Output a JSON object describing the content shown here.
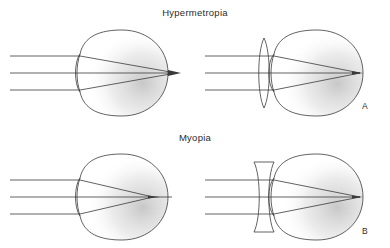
{
  "figure": {
    "background_color": "#ffffff",
    "ink_color": "#3a3a3a",
    "text_color": "#2b2b2b",
    "shading_color": "#8a8a8a",
    "width": 390,
    "height": 248
  },
  "titles": {
    "hypermetropia": "Hypermetropia",
    "myopia": "Myopia"
  },
  "panel_labels": {
    "a": "A",
    "b": "B"
  },
  "icons": {
    "convex_lens": "biconvex-lens-icon",
    "concave_lens": "biconcave-lens-icon",
    "eyeball": "eyeball-icon",
    "light_ray": "light-ray-icon"
  },
  "diagrams": [
    {
      "id": "hypermetropia-uncorrected",
      "row": "hypermetropia",
      "position": "left",
      "condition": "Hypermetropia",
      "corrected": false,
      "lens": null,
      "focal_point_relative_to_retina": "behind",
      "ray_count": 3,
      "eye": {
        "center_x": 123,
        "center_y": 73,
        "radius_x": 45,
        "radius_y": 43,
        "cornea_apex_x": 78,
        "retina_x": 168
      },
      "rays": {
        "start_x": 10,
        "y_values": [
          56,
          73,
          90
        ],
        "entry_x": 80,
        "focus_x": 176,
        "focus_y": 73
      }
    },
    {
      "id": "hypermetropia-corrected",
      "row": "hypermetropia",
      "position": "right",
      "condition": "Hypermetropia",
      "corrected": true,
      "lens": "biconvex",
      "focal_point_relative_to_retina": "on retina",
      "ray_count": 3,
      "eye": {
        "center_x": 318,
        "center_y": 73,
        "radius_x": 45,
        "radius_y": 43,
        "cornea_apex_x": 272,
        "retina_x": 363
      },
      "lens_geometry": {
        "center_x": 264,
        "center_y": 73,
        "half_height": 35,
        "bulge": 7
      },
      "rays": {
        "start_x": 205,
        "y_values": [
          56,
          73,
          90
        ],
        "entry_x": 274,
        "focus_x": 360,
        "focus_y": 73
      }
    },
    {
      "id": "myopia-uncorrected",
      "row": "myopia",
      "position": "left",
      "condition": "Myopia",
      "corrected": false,
      "lens": null,
      "focal_point_relative_to_retina": "in front of",
      "ray_count": 3,
      "eye": {
        "center_x": 123,
        "center_y": 197,
        "radius_x": 45,
        "radius_y": 43,
        "cornea_apex_x": 78,
        "retina_x": 168
      },
      "rays": {
        "start_x": 10,
        "y_values": [
          180,
          197,
          214
        ],
        "entry_x": 80,
        "focus_x": 153,
        "focus_y": 197
      }
    },
    {
      "id": "myopia-corrected",
      "row": "myopia",
      "position": "right",
      "condition": "Myopia",
      "corrected": true,
      "lens": "biconcave",
      "focal_point_relative_to_retina": "on retina",
      "ray_count": 3,
      "eye": {
        "center_x": 318,
        "center_y": 197,
        "radius_x": 45,
        "radius_y": 43,
        "cornea_apex_x": 272,
        "retina_x": 363
      },
      "lens_geometry": {
        "center_x": 264,
        "center_y": 197,
        "half_height": 35,
        "waist": 7
      },
      "rays": {
        "start_x": 205,
        "y_values": [
          180,
          197,
          214
        ],
        "entry_x": 274,
        "focus_x": 360,
        "focus_y": 197
      }
    }
  ]
}
